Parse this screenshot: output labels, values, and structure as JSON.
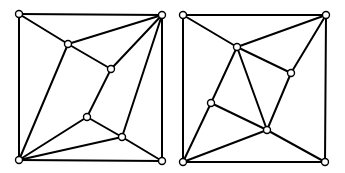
{
  "diagram": {
    "type": "graph-pair",
    "colors": {
      "background": "#ffffff",
      "stroke": "#000000",
      "node_fill": "#ffffff"
    },
    "node_radius": 3.5,
    "graphs": [
      {
        "id": "left-graph",
        "nodes": {
          "TL": [
            19,
            14
          ],
          "TR": [
            162,
            15
          ],
          "BL": [
            19,
            160
          ],
          "BR": [
            162,
            161
          ],
          "A": [
            68,
            44
          ],
          "B": [
            111,
            69
          ],
          "C": [
            87,
            117
          ],
          "D": [
            122,
            137
          ]
        },
        "edges": [
          [
            "TL",
            "TR"
          ],
          [
            "TR",
            "BR"
          ],
          [
            "BR",
            "BL"
          ],
          [
            "BL",
            "TL"
          ],
          [
            "TL",
            "A"
          ],
          [
            "A",
            "TR"
          ],
          [
            "A",
            "B"
          ],
          [
            "A",
            "BL"
          ],
          [
            "B",
            "TR"
          ],
          [
            "B",
            "C"
          ],
          [
            "C",
            "BL"
          ],
          [
            "C",
            "D"
          ],
          [
            "D",
            "TR"
          ],
          [
            "D",
            "BL"
          ],
          [
            "D",
            "BR"
          ]
        ]
      },
      {
        "id": "right-graph",
        "nodes": {
          "TL": [
            183,
            15
          ],
          "TR": [
            326,
            15
          ],
          "BL": [
            183,
            162
          ],
          "BR": [
            325,
            162
          ],
          "P": [
            237,
            47
          ],
          "Q": [
            291,
            73
          ],
          "R": [
            211,
            103
          ],
          "S": [
            267,
            130
          ]
        },
        "edges": [
          [
            "TL",
            "TR"
          ],
          [
            "TR",
            "BR"
          ],
          [
            "BR",
            "BL"
          ],
          [
            "BL",
            "TL"
          ],
          [
            "TL",
            "P"
          ],
          [
            "P",
            "TR"
          ],
          [
            "TR",
            "Q"
          ],
          [
            "P",
            "Q"
          ],
          [
            "P",
            "R"
          ],
          [
            "P",
            "S"
          ],
          [
            "Q",
            "S"
          ],
          [
            "R",
            "S"
          ],
          [
            "BL",
            "R"
          ],
          [
            "BL",
            "S"
          ],
          [
            "S",
            "BR"
          ]
        ]
      }
    ]
  }
}
